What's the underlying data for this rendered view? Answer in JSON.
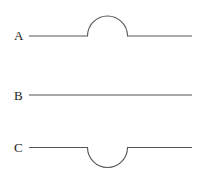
{
  "diagram": {
    "lines": [
      {
        "label": "A",
        "shape": "bump-up"
      },
      {
        "label": "B",
        "shape": "straight"
      },
      {
        "label": "C",
        "shape": "bump-down"
      }
    ],
    "colors": {
      "stroke": "#555555",
      "text": "#222222",
      "background": "#ffffff"
    }
  }
}
